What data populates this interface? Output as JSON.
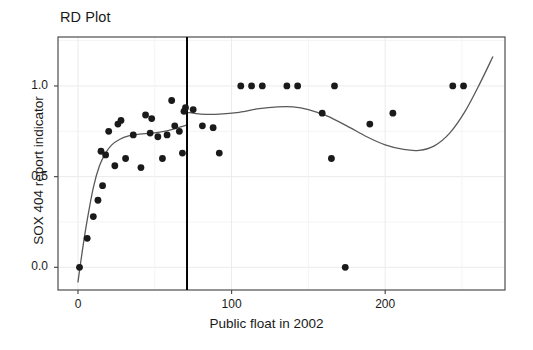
{
  "figure": {
    "title": "RD Plot",
    "background_color": "#ffffff",
    "frame_color": "#4d4d4d",
    "grid_color": "#ebebeb",
    "point_color": "#1a1a1a",
    "fit_line_color": "#595959",
    "cutoff_line_color": "#000000"
  },
  "chart_data": {
    "type": "scatter",
    "title": "RD Plot",
    "xlabel": "Public float in 2002",
    "ylabel": "SOX 404 report indicator",
    "xlim": [
      -13,
      278
    ],
    "ylim": [
      -0.125,
      1.27
    ],
    "xticks": [
      0,
      100,
      200
    ],
    "xtick_labels": [
      "0",
      "100",
      "200"
    ],
    "yticks": [
      0.0,
      0.5,
      1.0
    ],
    "ytick_labels": [
      "0.0",
      "0.5",
      "1.0"
    ],
    "grid": true,
    "legend": "none",
    "cutoff": {
      "x": 71,
      "label": "",
      "style": "solid-vertical"
    },
    "points": [
      {
        "x": 1,
        "y": 0.0
      },
      {
        "x": 6,
        "y": 0.16
      },
      {
        "x": 10,
        "y": 0.28
      },
      {
        "x": 13,
        "y": 0.37
      },
      {
        "x": 16,
        "y": 0.45
      },
      {
        "x": 15,
        "y": 0.64
      },
      {
        "x": 18,
        "y": 0.62
      },
      {
        "x": 20,
        "y": 0.75
      },
      {
        "x": 24,
        "y": 0.56
      },
      {
        "x": 26,
        "y": 0.79
      },
      {
        "x": 28,
        "y": 0.81
      },
      {
        "x": 31,
        "y": 0.6
      },
      {
        "x": 36,
        "y": 0.73
      },
      {
        "x": 41,
        "y": 0.55
      },
      {
        "x": 44,
        "y": 0.84
      },
      {
        "x": 48,
        "y": 0.82
      },
      {
        "x": 47,
        "y": 0.74
      },
      {
        "x": 52,
        "y": 0.72
      },
      {
        "x": 55,
        "y": 0.6
      },
      {
        "x": 58,
        "y": 0.73
      },
      {
        "x": 61,
        "y": 0.92
      },
      {
        "x": 63,
        "y": 0.78
      },
      {
        "x": 66,
        "y": 0.75
      },
      {
        "x": 69,
        "y": 0.86
      },
      {
        "x": 70,
        "y": 0.88
      },
      {
        "x": 68,
        "y": 0.63
      },
      {
        "x": 75,
        "y": 0.87
      },
      {
        "x": 81,
        "y": 0.78
      },
      {
        "x": 88,
        "y": 0.77
      },
      {
        "x": 92,
        "y": 0.63
      },
      {
        "x": 106,
        "y": 1.0
      },
      {
        "x": 113,
        "y": 1.0
      },
      {
        "x": 120,
        "y": 1.0
      },
      {
        "x": 136,
        "y": 1.0
      },
      {
        "x": 143,
        "y": 1.0
      },
      {
        "x": 159,
        "y": 0.85
      },
      {
        "x": 165,
        "y": 0.6
      },
      {
        "x": 167,
        "y": 1.0
      },
      {
        "x": 174,
        "y": 0.0
      },
      {
        "x": 190,
        "y": 0.79
      },
      {
        "x": 205,
        "y": 0.85
      },
      {
        "x": 244,
        "y": 1.0
      },
      {
        "x": 251,
        "y": 1.0
      }
    ],
    "fit_curves": [
      {
        "name": "left-of-cutoff-fit",
        "side": "left",
        "points": [
          {
            "x": 0,
            "y": -0.08
          },
          {
            "x": 3,
            "y": 0.1
          },
          {
            "x": 6,
            "y": 0.26
          },
          {
            "x": 10,
            "y": 0.44
          },
          {
            "x": 14,
            "y": 0.56
          },
          {
            "x": 18,
            "y": 0.63
          },
          {
            "x": 22,
            "y": 0.675
          },
          {
            "x": 27,
            "y": 0.705
          },
          {
            "x": 33,
            "y": 0.725
          },
          {
            "x": 40,
            "y": 0.735
          },
          {
            "x": 48,
            "y": 0.74
          },
          {
            "x": 56,
            "y": 0.75
          },
          {
            "x": 63,
            "y": 0.765
          },
          {
            "x": 71,
            "y": 0.785
          }
        ]
      },
      {
        "name": "right-of-cutoff-fit",
        "side": "right",
        "points": [
          {
            "x": 71,
            "y": 0.855
          },
          {
            "x": 80,
            "y": 0.845
          },
          {
            "x": 92,
            "y": 0.845
          },
          {
            "x": 105,
            "y": 0.855
          },
          {
            "x": 118,
            "y": 0.875
          },
          {
            "x": 130,
            "y": 0.885
          },
          {
            "x": 140,
            "y": 0.885
          },
          {
            "x": 150,
            "y": 0.87
          },
          {
            "x": 162,
            "y": 0.835
          },
          {
            "x": 175,
            "y": 0.78
          },
          {
            "x": 188,
            "y": 0.72
          },
          {
            "x": 200,
            "y": 0.675
          },
          {
            "x": 212,
            "y": 0.65
          },
          {
            "x": 222,
            "y": 0.645
          },
          {
            "x": 232,
            "y": 0.67
          },
          {
            "x": 242,
            "y": 0.74
          },
          {
            "x": 252,
            "y": 0.86
          },
          {
            "x": 262,
            "y": 1.02
          },
          {
            "x": 270,
            "y": 1.16
          }
        ]
      }
    ]
  }
}
